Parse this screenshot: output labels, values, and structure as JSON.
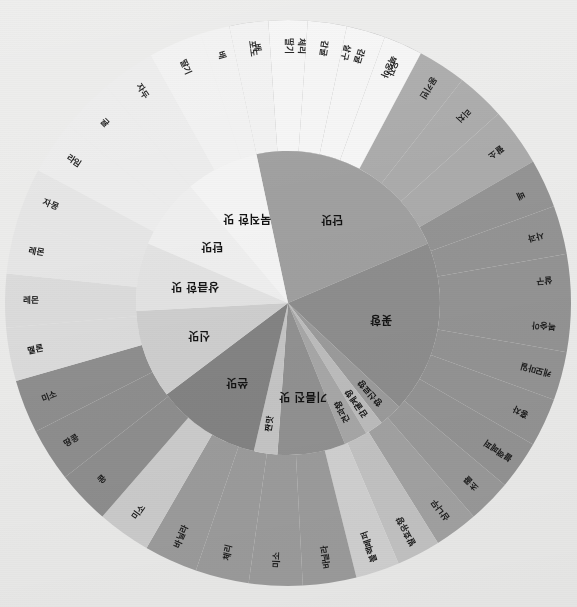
{
  "figure": {
    "title": "",
    "background_color": "#ececeb",
    "center_x": 288,
    "center_y": 303,
    "inner_radius": 0,
    "ring_boundary_radius": 152,
    "outer_radius": 283,
    "rotation_note": "wheel rendered upside-down; labels follow segment angle"
  },
  "chart_data": {
    "type": "pie",
    "title": "",
    "subtitle": "",
    "xlabel": "",
    "ylabel": "",
    "legend_position": "none",
    "grid": false,
    "rings": [
      {
        "name": "inner",
        "categories": [
          {
            "label": "단맛",
            "value": 79,
            "color": "#a0a0a0",
            "start_angle": 258,
            "end_angle": 337
          },
          {
            "label": "꽃향",
            "value": 66,
            "color": "#8e8e8e",
            "start_angle": 337,
            "end_angle": 43
          },
          {
            "label": "향신료향",
            "value": 9,
            "color": "#9c9c9c",
            "start_angle": 43,
            "end_angle": 52
          },
          {
            "label": "감귤계향",
            "value": 7,
            "color": "#bdbdbd",
            "start_angle": 52,
            "end_angle": 59
          },
          {
            "label": "견과향",
            "value": 9,
            "color": "#a8a8a8",
            "start_angle": 59,
            "end_angle": 68
          },
          {
            "label": "기름진 맛",
            "value": 26,
            "color": "#929292",
            "start_angle": 68,
            "end_angle": 94
          },
          {
            "label": "짠맛",
            "value": 9,
            "color": "#c6c6c6",
            "start_angle": 94,
            "end_angle": 103
          },
          {
            "label": "쓴맛",
            "value": 40,
            "color": "#848484",
            "start_angle": 103,
            "end_angle": 143
          },
          {
            "label": "신맛",
            "value": 34,
            "color": "#cfcfcf",
            "start_angle": 143,
            "end_angle": 177
          },
          {
            "label": "상큼한 맛",
            "value": 26,
            "color": "#e3e3e3",
            "start_angle": 177,
            "end_angle": 203
          },
          {
            "label": "탄맛",
            "value": 27,
            "color": "#efefef",
            "start_angle": 203,
            "end_angle": 230
          },
          {
            "label": "묵직한 맛",
            "value": 28,
            "color": "#f4f4f4",
            "start_angle": 230,
            "end_angle": 258
          }
        ]
      },
      {
        "name": "outer",
        "items": [
          {
            "label": "배",
            "parent": "단맛",
            "color": "#a8a8a8"
          },
          {
            "label": "팔소",
            "parent": "단맛",
            "color": "#b3b3b3"
          },
          {
            "label": "리치",
            "parent": "단맛",
            "color": "#b3b3b3"
          },
          {
            "label": "몽키빈",
            "parent": "단맛",
            "color": "#b3b3b3"
          },
          {
            "label": "복숭아",
            "parent": "단맛",
            "color": "#b3b3b3"
          },
          {
            "label": "살구",
            "parent": "단맛",
            "color": "#b3b3b3"
          },
          {
            "label": "체리",
            "parent": "단맛",
            "color": "#b3b3b3"
          },
          {
            "label": "배",
            "parent": "단맛",
            "color": "#b3b3b3"
          },
          {
            "label": "사과",
            "parent": "꽃향",
            "color": "#949494"
          },
          {
            "label": "살구",
            "parent": "꽃향",
            "color": "#949494"
          },
          {
            "label": "복숭아",
            "parent": "꽃향",
            "color": "#949494"
          },
          {
            "label": "캐모마일",
            "parent": "꽃향",
            "color": "#949494"
          },
          {
            "label": "홍차",
            "parent": "꽃향",
            "color": "#949494"
          },
          {
            "label": "블랙페퍼",
            "parent": "꽃향",
            "color": "#949494"
          },
          {
            "label": "초콜",
            "parent": "꽃향",
            "color": "#949494"
          },
          {
            "label": "삼나무",
            "parent": "향신료향",
            "color": "#a3a3a3"
          },
          {
            "label": "발효유향",
            "parent": "감귤계향",
            "color": "#c4c4c4"
          },
          {
            "label": "블랙페퍼",
            "parent": "견과향",
            "color": "#d2d2d2"
          },
          {
            "label": "바닐라",
            "parent": "기름진 맛",
            "color": "#9d9d9d"
          },
          {
            "label": "미소",
            "parent": "기름진 맛",
            "color": "#9d9d9d"
          },
          {
            "label": "체리",
            "parent": "기름진 맛",
            "color": "#9d9d9d"
          },
          {
            "label": "바닐라",
            "parent": "기름진 맛",
            "color": "#9d9d9d"
          },
          {
            "label": "미소",
            "parent": "짠맛",
            "color": "#cdcdcd"
          },
          {
            "label": "콩",
            "parent": "쓴맛",
            "color": "#8f8f8f"
          },
          {
            "label": "땅콩",
            "parent": "쓴맛",
            "color": "#8f8f8f"
          },
          {
            "label": "미소",
            "parent": "쓴맛",
            "color": "#8f8f8f"
          },
          {
            "label": "멜론",
            "parent": "신맛",
            "color": "#dcdcdc"
          },
          {
            "label": "레몬",
            "parent": "신맛",
            "color": "#dcdcdc"
          },
          {
            "label": "레몬",
            "parent": "신맛",
            "color": "#e6e6e6"
          },
          {
            "label": "자몽",
            "parent": "신맛",
            "color": "#e6e6e6"
          },
          {
            "label": "라임",
            "parent": "상큼한 맛",
            "color": "#ededed"
          },
          {
            "label": "귤",
            "parent": "상큼한 맛",
            "color": "#ededed"
          },
          {
            "label": "자두",
            "parent": "상큼한 맛",
            "color": "#ededed"
          },
          {
            "label": "딸기",
            "parent": "탄맛",
            "color": "#f2f2f2"
          },
          {
            "label": "배",
            "parent": "탄맛",
            "color": "#f2f2f2"
          },
          {
            "label": "포도",
            "parent": "탄맛",
            "color": "#f2f2f2"
          },
          {
            "label": "딸기",
            "parent": "묵직한 맛",
            "color": "#f6f6f6"
          },
          {
            "label": "감귤",
            "parent": "묵직한 맛",
            "color": "#f6f6f6"
          },
          {
            "label": "감귤",
            "parent": "묵직한 맛",
            "color": "#f6f6f6"
          },
          {
            "label": "유자",
            "parent": "묵직한 맛",
            "color": "#f6f6f6"
          }
        ]
      }
    ]
  },
  "inner_ring": [
    {
      "label": "단맛",
      "start": 258,
      "end": 337,
      "color": "#a0a0a0",
      "font": "big"
    },
    {
      "label": "꽃향",
      "start": 337,
      "end": 403,
      "color": "#8e8e8e",
      "font": "big"
    },
    {
      "label": "향신료향",
      "start": 403,
      "end": 412,
      "color": "#9c9c9c",
      "font": "small"
    },
    {
      "label": "감귤계향",
      "start": 412,
      "end": 419,
      "color": "#bdbdbd",
      "font": "small"
    },
    {
      "label": "견과향",
      "start": 419,
      "end": 428,
      "color": "#a8a8a8",
      "font": "small"
    },
    {
      "label": "기름진 맛",
      "start": 428,
      "end": 454,
      "color": "#929292",
      "font": "big"
    },
    {
      "label": "짠맛",
      "start": 454,
      "end": 463,
      "color": "#c6c6c6",
      "font": "small"
    },
    {
      "label": "쓴맛",
      "start": 463,
      "end": 503,
      "color": "#848484",
      "font": "big"
    },
    {
      "label": "신맛",
      "start": 503,
      "end": 537,
      "color": "#cfcfcf",
      "font": "big"
    },
    {
      "label": "상큼한 맛",
      "start": 537,
      "end": 563,
      "color": "#e3e3e3",
      "font": "big"
    },
    {
      "label": "탄맛",
      "start": 563,
      "end": 590,
      "color": "#efefef",
      "font": "big"
    },
    {
      "label": "묵직한 맛",
      "start": 590,
      "end": 618,
      "color": "#f4f4f4",
      "font": "big"
    }
  ],
  "outer_ring": [
    {
      "label": "배",
      "start": 258,
      "end": 268,
      "color": "#a8a8a8"
    },
    {
      "label": "체리",
      "start": 268,
      "end": 278,
      "color": "#ababab"
    },
    {
      "label": "살구",
      "start": 278,
      "end": 288,
      "color": "#ababab"
    },
    {
      "label": "복숭아",
      "start": 288,
      "end": 298,
      "color": "#ababab"
    },
    {
      "label": "몽키빈",
      "start": 298,
      "end": 308,
      "color": "#ababab"
    },
    {
      "label": "리치",
      "start": 308,
      "end": 318,
      "color": "#ababab"
    },
    {
      "label": "팔소",
      "start": 318,
      "end": 330,
      "color": "#ababab"
    },
    {
      "label": "배",
      "start": 330,
      "end": 340,
      "color": "#949494"
    },
    {
      "label": "사과",
      "start": 340,
      "end": 350,
      "color": "#949494"
    },
    {
      "label": "살구",
      "start": 350,
      "end": 360,
      "color": "#949494"
    },
    {
      "label": "복숭아",
      "start": 360,
      "end": 370,
      "color": "#949494"
    },
    {
      "label": "캐모마일",
      "start": 370,
      "end": 380,
      "color": "#949494"
    },
    {
      "label": "홍차",
      "start": 380,
      "end": 390,
      "color": "#949494"
    },
    {
      "label": "블랙페퍼",
      "start": 390,
      "end": 400,
      "color": "#949494"
    },
    {
      "label": "초콜",
      "start": 400,
      "end": 409,
      "color": "#9a9a9a"
    },
    {
      "label": "삼나무",
      "start": 409,
      "end": 418,
      "color": "#a3a3a3"
    },
    {
      "label": "발효유향",
      "start": 418,
      "end": 427,
      "color": "#c4c4c4"
    },
    {
      "label": "블랙페퍼",
      "start": 427,
      "end": 436,
      "color": "#d2d2d2"
    },
    {
      "label": "바닐라",
      "start": 436,
      "end": 447,
      "color": "#9d9d9d"
    },
    {
      "label": "미소",
      "start": 447,
      "end": 458,
      "color": "#9d9d9d"
    },
    {
      "label": "체리",
      "start": 458,
      "end": 469,
      "color": "#9d9d9d"
    },
    {
      "label": "바닐라",
      "start": 469,
      "end": 480,
      "color": "#9d9d9d"
    },
    {
      "label": "미소",
      "start": 480,
      "end": 491,
      "color": "#cdcdcd"
    },
    {
      "label": "콩",
      "start": 491,
      "end": 502,
      "color": "#8f8f8f"
    },
    {
      "label": "땅콩",
      "start": 502,
      "end": 513,
      "color": "#8f8f8f"
    },
    {
      "label": "미소",
      "start": 513,
      "end": 524,
      "color": "#8f8f8f"
    },
    {
      "label": "멜론",
      "start": 524,
      "end": 535,
      "color": "#dcdcdc"
    },
    {
      "label": "레몬",
      "start": 535,
      "end": 546,
      "color": "#dcdcdc"
    },
    {
      "label": "레몬",
      "start": 546,
      "end": 557,
      "color": "#e6e6e6"
    },
    {
      "label": "자몽",
      "start": 557,
      "end": 568,
      "color": "#e6e6e6"
    },
    {
      "label": "라임",
      "start": 568,
      "end": 579,
      "color": "#ededed"
    },
    {
      "label": "귤",
      "start": 579,
      "end": 590,
      "color": "#ededed"
    },
    {
      "label": "자두",
      "start": 590,
      "end": 601,
      "color": "#ededed"
    },
    {
      "label": "딸기",
      "start": 601,
      "end": 612,
      "color": "#f2f2f2"
    },
    {
      "label": "배",
      "start": 612,
      "end": 618,
      "color": "#f2f2f2"
    },
    {
      "label": "포도",
      "start": 618,
      "end": 626,
      "color": "#f2f2f2"
    },
    {
      "label": "딸기",
      "start": 626,
      "end": 634,
      "color": "#f6f6f6"
    },
    {
      "label": "감귤",
      "start": 634,
      "end": 642,
      "color": "#f6f6f6"
    },
    {
      "label": "감귤",
      "start": 642,
      "end": 650,
      "color": "#f6f6f6"
    },
    {
      "label": "유자",
      "start": 650,
      "end": 658,
      "color": "#f6f6f6"
    }
  ]
}
